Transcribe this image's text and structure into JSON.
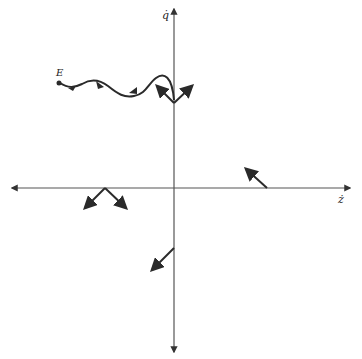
{
  "diagram": {
    "type": "phase-plane",
    "axes": {
      "horizontal_label": "ż",
      "vertical_label": "q̇"
    },
    "point_label": "E",
    "colors": {
      "ink": "#2a2a2a",
      "axis": "#555555",
      "background": "#ffffff"
    },
    "elements": [
      {
        "name": "trajectory-curve",
        "description": "wavy trajectory from point E to the vertical axis with direction arrows"
      },
      {
        "name": "vector-pair-upper-axis",
        "description": "two arrows diverging up-left and up-right from vertical axis"
      },
      {
        "name": "vector-right-axis",
        "description": "single arrow pointing up-left from positive horizontal axis"
      },
      {
        "name": "vector-pair-left-axis",
        "description": "two arrows diverging down-left and down-right from negative horizontal axis"
      },
      {
        "name": "vector-lower-axis",
        "description": "single arrow pointing down-left from negative vertical axis"
      }
    ]
  }
}
